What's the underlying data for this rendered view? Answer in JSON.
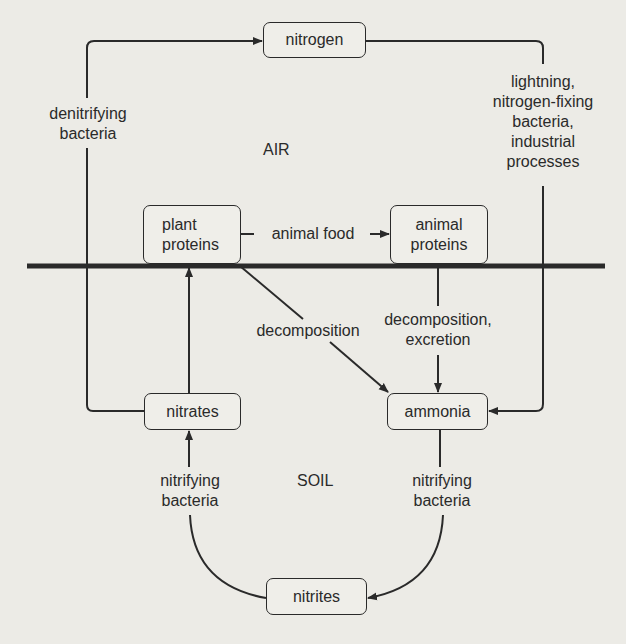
{
  "diagram": {
    "zones": {
      "upper": "AIR",
      "lower": "SOIL"
    },
    "nodes": {
      "nitrogen": "nitrogen",
      "plant_proteins": "plant\nproteins",
      "animal_proteins": "animal\nproteins",
      "nitrates": "nitrates",
      "ammonia": "ammonia",
      "nitrites": "nitrites"
    },
    "edge_labels": {
      "denitrifying": "denitrifying\nbacteria",
      "fixation": "lightning,\nnitrogen-fixing\nbacteria,\nindustrial\nprocesses",
      "animal_food": "animal food",
      "decomposition": "decomposition",
      "decomposition_excretion": "decomposition,\nexcretion",
      "nitrifying_left": "nitrifying\nbacteria",
      "nitrifying_right": "nitrifying\nbacteria"
    },
    "edges": [
      {
        "from": "nitrates",
        "to": "nitrogen",
        "label": "denitrifying bacteria"
      },
      {
        "from": "nitrogen",
        "to": "ammonia",
        "label": "lightning, nitrogen-fixing bacteria, industrial processes"
      },
      {
        "from": "plant_proteins",
        "to": "animal_proteins",
        "label": "animal food"
      },
      {
        "from": "plant_proteins",
        "to": "ammonia",
        "label": "decomposition"
      },
      {
        "from": "animal_proteins",
        "to": "ammonia",
        "label": "decomposition, excretion"
      },
      {
        "from": "nitrates",
        "to": "plant_proteins",
        "label": ""
      },
      {
        "from": "ammonia",
        "to": "nitrites",
        "label": "nitrifying bacteria"
      },
      {
        "from": "nitrites",
        "to": "nitrates",
        "label": "nitrifying bacteria"
      }
    ],
    "colors": {
      "line": "#2a2a2a",
      "background": "#ecebe6"
    }
  }
}
